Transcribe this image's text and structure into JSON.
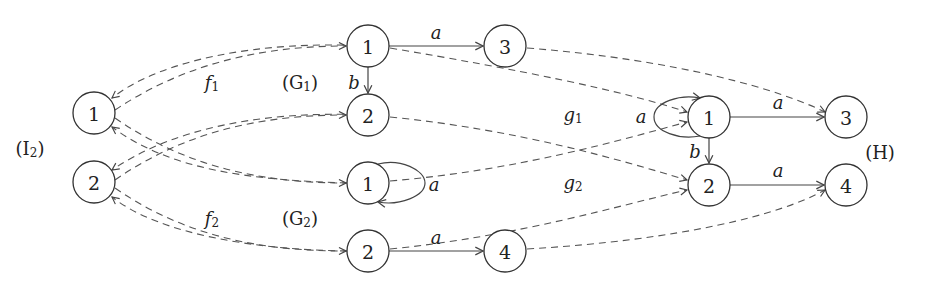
{
  "graphs": {
    "I2": {
      "label": "(I",
      "sub": "2",
      "close": ")",
      "nodes": [
        "1",
        "2"
      ]
    },
    "G1": {
      "label": "(G",
      "sub": "1",
      "close": ")",
      "nodes": [
        "1",
        "2",
        "3"
      ],
      "edges": [
        {
          "from": "1",
          "to": "3",
          "label": "a"
        },
        {
          "from": "1",
          "to": "2",
          "label": "b"
        }
      ]
    },
    "G2": {
      "label": "(G",
      "sub": "2",
      "close": ")",
      "nodes": [
        "1",
        "2",
        "4"
      ],
      "edges": [
        {
          "from": "1",
          "to": "1",
          "label": "a"
        },
        {
          "from": "2",
          "to": "4",
          "label": "a"
        }
      ]
    },
    "H": {
      "label": "(H)",
      "nodes": [
        "1",
        "2",
        "3",
        "4"
      ],
      "edges": [
        {
          "from": "1",
          "to": "1",
          "label": "a"
        },
        {
          "from": "1",
          "to": "3",
          "label": "a"
        },
        {
          "from": "1",
          "to": "2",
          "label": "b"
        },
        {
          "from": "2",
          "to": "4",
          "label": "a"
        }
      ]
    }
  },
  "morphisms": {
    "f1": {
      "name": "f",
      "sub": "1"
    },
    "f2": {
      "name": "f",
      "sub": "2"
    },
    "g1": {
      "name": "g",
      "sub": "1"
    },
    "g2": {
      "name": "g",
      "sub": "2"
    }
  },
  "edge_labels": {
    "g1_1_3": "a",
    "g1_1_2": "b",
    "g2_1_1": "a",
    "g2_2_4": "a",
    "h_1_1": "a",
    "h_1_3": "a",
    "h_1_2": "b",
    "h_2_4": "a"
  }
}
